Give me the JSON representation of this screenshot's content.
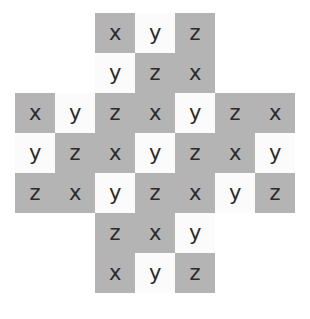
{
  "figure": {
    "name": "cross-shaped-letter-grid",
    "shape": "plus-cross",
    "columns": 7,
    "rows": 7,
    "cell_size_px": 40,
    "origin_x_px": 15,
    "origin_y_px": 13,
    "colors": {
      "shaded": "#b4b4b4",
      "unshaded": "#fbfbfb",
      "letter": "#2b2b2b",
      "page_background": "#ffffff"
    },
    "letters_used": [
      "x",
      "y",
      "z"
    ],
    "cells": [
      {
        "row": 1,
        "col": 3,
        "letter": "x",
        "fill": "shaded"
      },
      {
        "row": 1,
        "col": 4,
        "letter": "y",
        "fill": "unshaded"
      },
      {
        "row": 1,
        "col": 5,
        "letter": "z",
        "fill": "shaded"
      },
      {
        "row": 2,
        "col": 3,
        "letter": "y",
        "fill": "unshaded"
      },
      {
        "row": 2,
        "col": 4,
        "letter": "z",
        "fill": "shaded"
      },
      {
        "row": 2,
        "col": 5,
        "letter": "x",
        "fill": "shaded"
      },
      {
        "row": 3,
        "col": 1,
        "letter": "x",
        "fill": "shaded"
      },
      {
        "row": 3,
        "col": 2,
        "letter": "y",
        "fill": "unshaded"
      },
      {
        "row": 3,
        "col": 3,
        "letter": "z",
        "fill": "shaded"
      },
      {
        "row": 3,
        "col": 4,
        "letter": "x",
        "fill": "shaded"
      },
      {
        "row": 3,
        "col": 5,
        "letter": "y",
        "fill": "unshaded"
      },
      {
        "row": 3,
        "col": 6,
        "letter": "z",
        "fill": "shaded"
      },
      {
        "row": 3,
        "col": 7,
        "letter": "x",
        "fill": "shaded"
      },
      {
        "row": 4,
        "col": 1,
        "letter": "y",
        "fill": "unshaded"
      },
      {
        "row": 4,
        "col": 2,
        "letter": "z",
        "fill": "shaded"
      },
      {
        "row": 4,
        "col": 3,
        "letter": "x",
        "fill": "shaded"
      },
      {
        "row": 4,
        "col": 4,
        "letter": "y",
        "fill": "unshaded"
      },
      {
        "row": 4,
        "col": 5,
        "letter": "z",
        "fill": "shaded"
      },
      {
        "row": 4,
        "col": 6,
        "letter": "x",
        "fill": "shaded"
      },
      {
        "row": 4,
        "col": 7,
        "letter": "y",
        "fill": "unshaded"
      },
      {
        "row": 5,
        "col": 1,
        "letter": "z",
        "fill": "shaded"
      },
      {
        "row": 5,
        "col": 2,
        "letter": "x",
        "fill": "shaded"
      },
      {
        "row": 5,
        "col": 3,
        "letter": "y",
        "fill": "unshaded"
      },
      {
        "row": 5,
        "col": 4,
        "letter": "z",
        "fill": "shaded"
      },
      {
        "row": 5,
        "col": 5,
        "letter": "x",
        "fill": "shaded"
      },
      {
        "row": 5,
        "col": 6,
        "letter": "y",
        "fill": "unshaded"
      },
      {
        "row": 5,
        "col": 7,
        "letter": "z",
        "fill": "shaded"
      },
      {
        "row": 6,
        "col": 3,
        "letter": "z",
        "fill": "shaded"
      },
      {
        "row": 6,
        "col": 4,
        "letter": "x",
        "fill": "shaded"
      },
      {
        "row": 6,
        "col": 5,
        "letter": "y",
        "fill": "unshaded"
      },
      {
        "row": 7,
        "col": 3,
        "letter": "x",
        "fill": "shaded"
      },
      {
        "row": 7,
        "col": 4,
        "letter": "y",
        "fill": "unshaded"
      },
      {
        "row": 7,
        "col": 5,
        "letter": "z",
        "fill": "shaded"
      }
    ]
  }
}
